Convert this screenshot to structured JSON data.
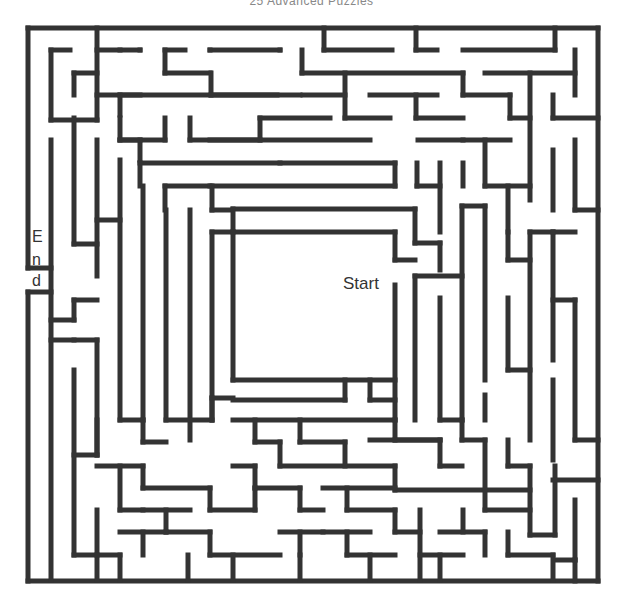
{
  "header": {
    "title": "25 Advanced Puzzles"
  },
  "labels": {
    "start": "Start",
    "end_letters": [
      "E",
      "n",
      "d"
    ]
  },
  "colors": {
    "wall": "#333333",
    "background": "#ffffff"
  },
  "maze": {
    "bounds": {
      "left": 28,
      "top": 28,
      "right": 598,
      "bottom": 581
    },
    "wall_width": 5,
    "walls": [
      [
        28,
        28,
        598,
        28
      ],
      [
        598,
        28,
        598,
        581
      ],
      [
        28,
        581,
        598,
        581
      ],
      [
        28,
        28,
        28,
        268
      ],
      [
        28,
        292,
        28,
        581
      ],
      [
        97,
        28,
        97,
        120
      ],
      [
        97,
        50,
        140,
        50
      ],
      [
        51,
        50,
        51,
        120
      ],
      [
        51,
        50,
        70,
        50
      ],
      [
        51,
        120,
        97,
        120
      ],
      [
        74,
        73,
        97,
        73
      ],
      [
        74,
        73,
        74,
        95
      ],
      [
        97,
        95,
        140,
        95
      ],
      [
        120,
        95,
        120,
        115
      ],
      [
        120,
        50,
        120,
        50
      ],
      [
        140,
        50,
        140,
        50
      ],
      [
        165,
        50,
        185,
        50
      ],
      [
        165,
        50,
        165,
        73
      ],
      [
        165,
        73,
        210,
        73
      ],
      [
        211,
        73,
        211,
        95
      ],
      [
        211,
        95,
        277,
        95
      ],
      [
        120,
        95,
        300,
        95
      ],
      [
        210,
        50,
        280,
        50
      ],
      [
        210,
        50,
        210,
        50
      ],
      [
        280,
        50,
        280,
        50
      ],
      [
        324,
        28,
        324,
        50
      ],
      [
        324,
        50,
        392,
        50
      ],
      [
        416,
        28,
        416,
        50
      ],
      [
        416,
        50,
        437,
        50
      ],
      [
        463,
        50,
        555,
        50
      ],
      [
        555,
        28,
        555,
        50
      ],
      [
        302,
        50,
        302,
        73
      ],
      [
        302,
        73,
        463,
        73
      ],
      [
        463,
        73,
        463,
        95
      ],
      [
        463,
        95,
        510,
        95
      ],
      [
        510,
        95,
        510,
        118
      ],
      [
        510,
        118,
        530,
        118
      ],
      [
        345,
        73,
        345,
        118
      ],
      [
        345,
        118,
        390,
        118
      ],
      [
        370,
        95,
        437,
        95
      ],
      [
        416,
        95,
        416,
        118
      ],
      [
        416,
        118,
        463,
        118
      ],
      [
        575,
        50,
        575,
        95
      ],
      [
        485,
        73,
        575,
        73
      ],
      [
        530,
        73,
        530,
        200
      ],
      [
        553,
        95,
        553,
        118
      ],
      [
        553,
        118,
        598,
        118
      ],
      [
        303,
        95,
        345,
        95
      ],
      [
        74,
        118,
        74,
        244
      ],
      [
        120,
        118,
        120,
        140
      ],
      [
        120,
        140,
        165,
        140
      ],
      [
        165,
        118,
        165,
        140
      ],
      [
        190,
        118,
        190,
        140
      ],
      [
        190,
        140,
        260,
        140
      ],
      [
        260,
        118,
        260,
        140
      ],
      [
        260,
        118,
        330,
        118
      ],
      [
        140,
        140,
        140,
        160
      ],
      [
        140,
        140,
        120,
        140
      ],
      [
        120,
        160,
        120,
        420
      ],
      [
        140,
        163,
        140,
        186
      ],
      [
        140,
        163,
        395,
        163
      ],
      [
        395,
        163,
        395,
        186
      ],
      [
        210,
        140,
        370,
        140
      ],
      [
        280,
        163,
        280,
        163
      ],
      [
        418,
        140,
        510,
        140
      ],
      [
        463,
        140,
        463,
        140
      ],
      [
        165,
        186,
        395,
        186
      ],
      [
        165,
        186,
        165,
        210
      ],
      [
        210,
        186,
        210,
        186
      ],
      [
        417,
        163,
        417,
        186
      ],
      [
        417,
        186,
        440,
        186
      ],
      [
        440,
        163,
        440,
        232
      ],
      [
        463,
        163,
        463,
        186
      ],
      [
        485,
        140,
        485,
        186
      ],
      [
        485,
        186,
        530,
        186
      ],
      [
        508,
        186,
        508,
        232
      ],
      [
        553,
        150,
        553,
        210
      ],
      [
        575,
        140,
        575,
        210
      ],
      [
        575,
        210,
        598,
        210
      ],
      [
        51,
        140,
        51,
        580
      ],
      [
        51,
        268,
        28,
        268
      ],
      [
        51,
        292,
        28,
        292
      ],
      [
        97,
        140,
        97,
        276
      ],
      [
        74,
        244,
        97,
        244
      ],
      [
        97,
        220,
        120,
        220
      ],
      [
        143,
        186,
        143,
        420
      ],
      [
        166,
        210,
        166,
        420
      ],
      [
        190,
        210,
        190,
        440
      ],
      [
        212,
        186,
        212,
        210
      ],
      [
        212,
        210,
        232,
        210
      ],
      [
        233,
        209,
        415,
        209
      ],
      [
        415,
        209,
        415,
        243
      ],
      [
        415,
        243,
        440,
        243
      ],
      [
        440,
        243,
        440,
        270
      ],
      [
        233,
        209,
        233,
        230
      ],
      [
        212,
        232,
        233,
        232
      ],
      [
        212,
        232,
        212,
        420
      ],
      [
        233,
        232,
        395,
        232
      ],
      [
        233,
        232,
        233,
        380
      ],
      [
        233,
        380,
        395,
        380
      ],
      [
        395,
        232,
        395,
        260
      ],
      [
        395,
        260,
        415,
        260
      ],
      [
        395,
        285,
        395,
        420
      ],
      [
        415,
        276,
        415,
        420
      ],
      [
        415,
        276,
        462,
        276
      ],
      [
        440,
        298,
        440,
        420
      ],
      [
        462,
        206,
        462,
        420
      ],
      [
        462,
        206,
        485,
        206
      ],
      [
        485,
        206,
        485,
        380
      ],
      [
        485,
        395,
        485,
        420
      ],
      [
        508,
        232,
        508,
        260
      ],
      [
        508,
        260,
        530,
        260
      ],
      [
        530,
        232,
        530,
        440
      ],
      [
        508,
        298,
        508,
        370
      ],
      [
        508,
        370,
        530,
        370
      ],
      [
        553,
        232,
        553,
        360
      ],
      [
        553,
        300,
        575,
        300
      ],
      [
        575,
        300,
        575,
        440
      ],
      [
        553,
        380,
        553,
        460
      ],
      [
        575,
        440,
        598,
        440
      ],
      [
        530,
        232,
        575,
        232
      ],
      [
        553,
        232,
        553,
        232
      ],
      [
        97,
        300,
        74,
        300
      ],
      [
        74,
        300,
        74,
        320
      ],
      [
        74,
        320,
        51,
        320
      ],
      [
        74,
        340,
        97,
        340
      ],
      [
        97,
        340,
        97,
        455
      ],
      [
        51,
        340,
        74,
        340
      ],
      [
        120,
        420,
        143,
        420
      ],
      [
        143,
        420,
        143,
        442
      ],
      [
        143,
        442,
        166,
        442
      ],
      [
        166,
        420,
        212,
        420
      ],
      [
        212,
        420,
        212,
        398
      ],
      [
        212,
        398,
        233,
        398
      ],
      [
        233,
        400,
        345,
        400
      ],
      [
        345,
        380,
        345,
        400
      ],
      [
        370,
        380,
        370,
        400
      ],
      [
        370,
        400,
        395,
        400
      ],
      [
        233,
        420,
        395,
        420
      ],
      [
        395,
        420,
        395,
        440
      ],
      [
        395,
        440,
        440,
        440
      ],
      [
        440,
        420,
        462,
        420
      ],
      [
        462,
        420,
        462,
        440
      ],
      [
        255,
        420,
        255,
        442
      ],
      [
        255,
        442,
        280,
        442
      ],
      [
        280,
        442,
        280,
        466
      ],
      [
        280,
        466,
        395,
        466
      ],
      [
        395,
        466,
        395,
        490
      ],
      [
        395,
        490,
        530,
        490
      ],
      [
        300,
        420,
        300,
        442
      ],
      [
        300,
        442,
        345,
        442
      ],
      [
        345,
        442,
        345,
        466
      ],
      [
        370,
        440,
        440,
        440
      ],
      [
        440,
        440,
        440,
        466
      ],
      [
        440,
        466,
        462,
        466
      ],
      [
        462,
        440,
        485,
        440
      ],
      [
        485,
        440,
        485,
        510
      ],
      [
        485,
        510,
        530,
        510
      ],
      [
        508,
        440,
        508,
        466
      ],
      [
        508,
        466,
        530,
        466
      ],
      [
        530,
        466,
        530,
        535
      ],
      [
        530,
        535,
        555,
        535
      ],
      [
        555,
        466,
        555,
        535
      ],
      [
        553,
        480,
        598,
        480
      ],
      [
        575,
        500,
        575,
        560
      ],
      [
        575,
        560,
        555,
        560
      ],
      [
        97,
        420,
        97,
        455
      ],
      [
        74,
        455,
        97,
        455
      ],
      [
        74,
        370,
        74,
        555
      ],
      [
        74,
        555,
        97,
        555
      ],
      [
        97,
        466,
        143,
        466
      ],
      [
        143,
        466,
        143,
        488
      ],
      [
        143,
        488,
        210,
        488
      ],
      [
        210,
        488,
        210,
        510
      ],
      [
        120,
        466,
        120,
        510
      ],
      [
        120,
        510,
        143,
        510
      ],
      [
        143,
        510,
        190,
        510
      ],
      [
        166,
        510,
        166,
        532
      ],
      [
        166,
        532,
        210,
        532
      ],
      [
        210,
        532,
        210,
        555
      ],
      [
        210,
        555,
        280,
        555
      ],
      [
        210,
        510,
        255,
        510
      ],
      [
        255,
        510,
        255,
        488
      ],
      [
        255,
        488,
        300,
        488
      ],
      [
        300,
        488,
        300,
        510
      ],
      [
        300,
        510,
        323,
        510
      ],
      [
        323,
        488,
        395,
        488
      ],
      [
        347,
        488,
        347,
        510
      ],
      [
        347,
        510,
        395,
        510
      ],
      [
        395,
        510,
        395,
        532
      ],
      [
        395,
        532,
        420,
        532
      ],
      [
        233,
        466,
        255,
        466
      ],
      [
        255,
        466,
        255,
        488
      ],
      [
        323,
        532,
        370,
        532
      ],
      [
        347,
        532,
        347,
        555
      ],
      [
        347,
        555,
        395,
        555
      ],
      [
        420,
        510,
        420,
        580
      ],
      [
        420,
        555,
        463,
        555
      ],
      [
        440,
        532,
        485,
        532
      ],
      [
        485,
        532,
        485,
        555
      ],
      [
        463,
        510,
        463,
        532
      ],
      [
        300,
        532,
        300,
        555
      ],
      [
        280,
        532,
        323,
        532
      ],
      [
        97,
        510,
        97,
        580
      ],
      [
        120,
        532,
        166,
        532
      ],
      [
        143,
        532,
        143,
        555
      ],
      [
        97,
        555,
        120,
        555
      ],
      [
        188,
        555,
        188,
        580
      ],
      [
        233,
        555,
        233,
        580
      ],
      [
        120,
        555,
        120,
        580
      ],
      [
        508,
        532,
        508,
        555
      ],
      [
        508,
        555,
        553,
        555
      ],
      [
        553,
        555,
        553,
        580
      ],
      [
        300,
        555,
        300,
        580
      ],
      [
        370,
        555,
        370,
        580
      ],
      [
        440,
        555,
        440,
        580
      ],
      [
        575,
        560,
        575,
        581
      ]
    ]
  }
}
